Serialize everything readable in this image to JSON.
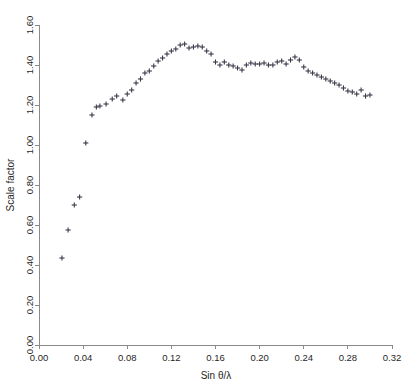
{
  "chart_data": {
    "type": "scatter",
    "title": "",
    "xlabel": "Sin θ/λ",
    "ylabel": "Scale factor",
    "xlim": [
      0.0,
      0.32
    ],
    "ylim": [
      0.0,
      1.6
    ],
    "xticks": [
      0.0,
      0.04,
      0.08,
      0.12,
      0.16,
      0.2,
      0.24,
      0.28,
      0.32
    ],
    "xtick_labels": [
      "0.00",
      "0.04",
      "0.08",
      "0.12",
      "0.16",
      "0.20",
      "0.24",
      "0.28",
      "0.32"
    ],
    "yticks": [
      0.0,
      0.2,
      0.4,
      0.6,
      0.8,
      1.0,
      1.2,
      1.4,
      1.6
    ],
    "ytick_labels": [
      "0.00",
      "0.20",
      "0.40",
      "0.60",
      "0.80",
      "1.00",
      "1.20",
      "1.40",
      "1.60"
    ],
    "grid": false,
    "legend": false,
    "marker": "plus",
    "marker_color": "#3a3a4a",
    "axis_color": "#8a8a8a",
    "series": [
      {
        "name": "Scale factor",
        "x": [
          0.0208,
          0.0264,
          0.032,
          0.0368,
          0.0424,
          0.048,
          0.052,
          0.0552,
          0.0608,
          0.0664,
          0.0704,
          0.076,
          0.08,
          0.084,
          0.088,
          0.092,
          0.096,
          0.1,
          0.104,
          0.108,
          0.112,
          0.116,
          0.12,
          0.124,
          0.128,
          0.132,
          0.136,
          0.14,
          0.144,
          0.148,
          0.152,
          0.156,
          0.16,
          0.164,
          0.168,
          0.172,
          0.176,
          0.18,
          0.184,
          0.188,
          0.192,
          0.196,
          0.2,
          0.204,
          0.208,
          0.212,
          0.216,
          0.22,
          0.224,
          0.228,
          0.232,
          0.236,
          0.24,
          0.244,
          0.248,
          0.252,
          0.256,
          0.26,
          0.264,
          0.268,
          0.272,
          0.276,
          0.28,
          0.284,
          0.288,
          0.292,
          0.296,
          0.3
        ],
        "y": [
          0.435,
          0.575,
          0.7,
          0.74,
          1.01,
          1.15,
          1.19,
          1.195,
          1.205,
          1.23,
          1.245,
          1.225,
          1.255,
          1.275,
          1.31,
          1.33,
          1.36,
          1.37,
          1.395,
          1.42,
          1.435,
          1.455,
          1.47,
          1.48,
          1.5,
          1.505,
          1.485,
          1.49,
          1.495,
          1.49,
          1.47,
          1.455,
          1.415,
          1.4,
          1.415,
          1.4,
          1.395,
          1.385,
          1.375,
          1.4,
          1.41,
          1.405,
          1.405,
          1.41,
          1.4,
          1.4,
          1.415,
          1.42,
          1.405,
          1.425,
          1.44,
          1.425,
          1.39,
          1.37,
          1.36,
          1.35,
          1.34,
          1.33,
          1.32,
          1.31,
          1.3,
          1.285,
          1.27,
          1.265,
          1.255,
          1.275,
          1.245,
          1.25
        ]
      }
    ]
  }
}
